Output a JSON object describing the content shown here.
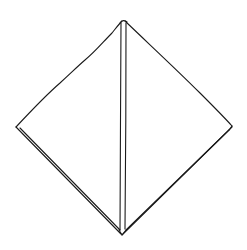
{
  "figure": {
    "type": "line-drawing",
    "background": "#ffffff",
    "stroke_color": "#1a1a1a",
    "vertices": {
      "top": [
        123,
        21
      ],
      "left": [
        16,
        127
      ],
      "right": [
        232,
        127
      ],
      "bottom": [
        122,
        235
      ]
    },
    "center_fold": {
      "x_left": 121,
      "x_right": 126,
      "y_top": 22,
      "y_bottom": 232
    },
    "label": ""
  }
}
